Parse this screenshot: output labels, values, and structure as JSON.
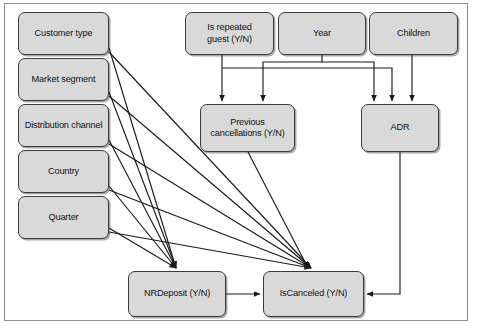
{
  "diagram": {
    "type": "directed-graph",
    "style": {
      "node_fill": "#d9d9d9",
      "node_stroke": "#3a3a3a",
      "edge_color": "#1a1a1a",
      "frame_stroke": "#8d8d8d",
      "background": "#ffffff"
    },
    "nodes": [
      {
        "id": "customer_type",
        "label": "Customer type",
        "x": 18,
        "y": 12,
        "w": 91,
        "h": 43
      },
      {
        "id": "market_segment",
        "label": "Market segment",
        "x": 18,
        "y": 58,
        "w": 91,
        "h": 43
      },
      {
        "id": "distribution_channel",
        "label": "Distribution channel",
        "x": 18,
        "y": 104,
        "w": 91,
        "h": 43
      },
      {
        "id": "country",
        "label": "Country",
        "x": 18,
        "y": 150,
        "w": 91,
        "h": 43
      },
      {
        "id": "quarter",
        "label": "Quarter",
        "x": 18,
        "y": 196,
        "w": 91,
        "h": 43
      },
      {
        "id": "is_repeated_guest",
        "label": "Is repeated\nguest (Y/N)",
        "x": 185,
        "y": 12,
        "w": 89,
        "h": 43
      },
      {
        "id": "year",
        "label": "Year",
        "x": 278,
        "y": 12,
        "w": 88,
        "h": 43
      },
      {
        "id": "children",
        "label": "Children",
        "x": 369,
        "y": 12,
        "w": 89,
        "h": 43
      },
      {
        "id": "previous_cancellations",
        "label": "Previous\ncancellations (Y/N)",
        "x": 200,
        "y": 104,
        "w": 95,
        "h": 48
      },
      {
        "id": "adr",
        "label": "ADR",
        "x": 361,
        "y": 104,
        "w": 78,
        "h": 48
      },
      {
        "id": "nrdeposit",
        "label": "NRDeposit (Y/N)",
        "x": 128,
        "y": 271,
        "w": 98,
        "h": 46
      },
      {
        "id": "iscanceled",
        "label": "IsCanceled (Y/N)",
        "x": 263,
        "y": 271,
        "w": 101,
        "h": 46
      }
    ],
    "edges": [
      {
        "from": "customer_type",
        "to": "nrdeposit"
      },
      {
        "from": "customer_type",
        "to": "iscanceled"
      },
      {
        "from": "market_segment",
        "to": "nrdeposit"
      },
      {
        "from": "market_segment",
        "to": "iscanceled"
      },
      {
        "from": "distribution_channel",
        "to": "nrdeposit"
      },
      {
        "from": "distribution_channel",
        "to": "iscanceled"
      },
      {
        "from": "country",
        "to": "nrdeposit"
      },
      {
        "from": "country",
        "to": "iscanceled"
      },
      {
        "from": "quarter",
        "to": "nrdeposit"
      },
      {
        "from": "quarter",
        "to": "iscanceled"
      },
      {
        "from": "is_repeated_guest",
        "to": "previous_cancellations"
      },
      {
        "from": "is_repeated_guest",
        "to": "adr"
      },
      {
        "from": "year",
        "to": "previous_cancellations"
      },
      {
        "from": "year",
        "to": "adr"
      },
      {
        "from": "children",
        "to": "adr"
      },
      {
        "from": "previous_cancellations",
        "to": "iscanceled"
      },
      {
        "from": "adr",
        "to": "iscanceled"
      },
      {
        "from": "nrdeposit",
        "to": "iscanceled"
      }
    ]
  }
}
